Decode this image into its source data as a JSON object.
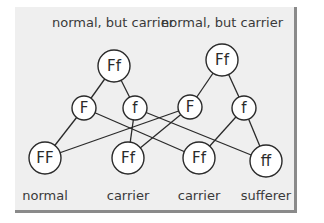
{
  "diagram": {
    "title_labels": [
      {
        "text": "normal, but carrier",
        "x": 113,
        "y": 27
      },
      {
        "text": "normal, but carrier",
        "x": 222,
        "y": 27
      }
    ],
    "parents": [
      {
        "id": "p1",
        "label": "Ff",
        "x": 114,
        "y": 66,
        "r": 16
      },
      {
        "id": "p2",
        "label": "Ff",
        "x": 222,
        "y": 60,
        "r": 16
      }
    ],
    "gametes": [
      {
        "id": "g1",
        "label": "F",
        "x": 84,
        "y": 108,
        "r": 12
      },
      {
        "id": "g2",
        "label": "f",
        "x": 135,
        "y": 108,
        "r": 12
      },
      {
        "id": "g3",
        "label": "F",
        "x": 190,
        "y": 107,
        "r": 12
      },
      {
        "id": "g4",
        "label": "f",
        "x": 244,
        "y": 108,
        "r": 12
      }
    ],
    "offspring": [
      {
        "id": "o1",
        "label": "FF",
        "x": 45,
        "y": 158,
        "r": 16,
        "status": "normal"
      },
      {
        "id": "o2",
        "label": "Ff",
        "x": 128,
        "y": 158,
        "r": 16,
        "status": "carrier"
      },
      {
        "id": "o3",
        "label": "Ff",
        "x": 199,
        "y": 158,
        "r": 16,
        "status": "carrier"
      },
      {
        "id": "o4",
        "label": "ff",
        "x": 266,
        "y": 161,
        "r": 16,
        "status": "sufferer"
      }
    ],
    "edges": [
      [
        "p1",
        "g1"
      ],
      [
        "p1",
        "g2"
      ],
      [
        "p2",
        "g3"
      ],
      [
        "p2",
        "g4"
      ],
      [
        "g1",
        "o1"
      ],
      [
        "g1",
        "o3"
      ],
      [
        "g2",
        "o2"
      ],
      [
        "g2",
        "o4"
      ],
      [
        "g3",
        "o1"
      ],
      [
        "g3",
        "o2"
      ],
      [
        "g4",
        "o3"
      ],
      [
        "g4",
        "o4"
      ]
    ],
    "status_label_y": 200,
    "colors": {
      "panel_bg": "#efefef",
      "panel_border": "#8a8a8a",
      "line": "#2a2a2a",
      "text": "#3a3a3a"
    }
  }
}
